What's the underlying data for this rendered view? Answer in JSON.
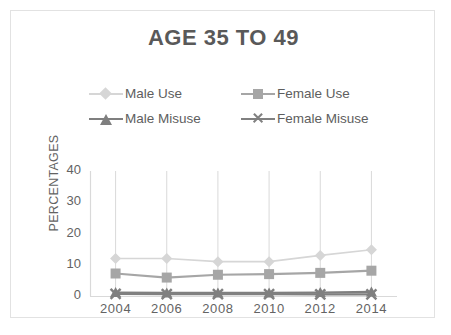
{
  "chart_data": {
    "type": "line",
    "title": "AGE 35 TO 49",
    "xlabel": "",
    "ylabel": "PERCENTAGES",
    "x": [
      2004,
      2006,
      2008,
      2010,
      2012,
      2014
    ],
    "categories": [
      "2004",
      "2006",
      "2008",
      "2010",
      "2012",
      "2014"
    ],
    "ylim": [
      0,
      40
    ],
    "yticks": [
      0,
      10,
      20,
      30,
      40
    ],
    "ytick_labels": [
      "0",
      "10",
      "20",
      "30",
      "40"
    ],
    "grid": "vertical-only",
    "legend_position": "top",
    "series": [
      {
        "name": "Male Use",
        "marker": "diamond",
        "color": "#d6d6d6",
        "values": [
          12,
          12,
          11,
          11,
          13,
          14.8
        ]
      },
      {
        "name": "Female Use",
        "marker": "square",
        "color": "#a6a6a6",
        "values": [
          7.2,
          5.9,
          6.8,
          7.0,
          7.4,
          8.1
        ]
      },
      {
        "name": "Male Misuse",
        "marker": "triangle",
        "color": "#7f7f7f",
        "values": [
          1.1,
          1.0,
          1.0,
          1.0,
          1.1,
          1.3
        ]
      },
      {
        "name": "Female Misuse",
        "marker": "x",
        "color": "#808080",
        "values": [
          0.7,
          0.6,
          0.6,
          0.6,
          0.5,
          0.5
        ]
      }
    ]
  },
  "colors": {
    "title": "#595959",
    "axis_text": "#636363",
    "gridline": "#d9d9d9",
    "border": "#e2e2e2",
    "background": "#ffffff"
  }
}
